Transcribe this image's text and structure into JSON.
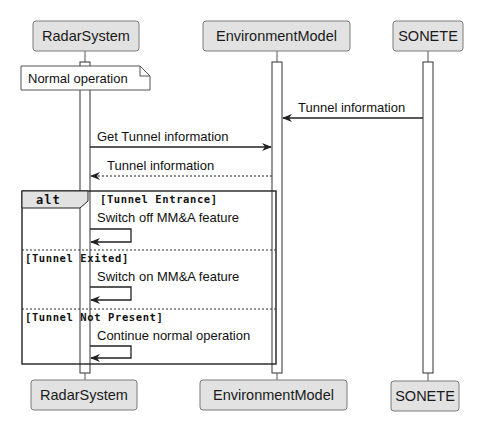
{
  "colors": {
    "participant_fill": "#e2e2e2",
    "participant_border": "#7a7a7a",
    "line": "#222222",
    "background": "#ffffff"
  },
  "participants": [
    {
      "name": "RadarSystem"
    },
    {
      "name": "EnvironmentModel"
    },
    {
      "name": "SONETE"
    }
  ],
  "note": {
    "text": "Normal operation",
    "over": "RadarSystem"
  },
  "messages": [
    {
      "from": "SONETE",
      "to": "EnvironmentModel",
      "label": "Tunnel information",
      "style": "solid"
    },
    {
      "from": "RadarSystem",
      "to": "EnvironmentModel",
      "label": "Get Tunnel information",
      "style": "solid"
    },
    {
      "from": "EnvironmentModel",
      "to": "RadarSystem",
      "label": "Tunnel information",
      "style": "dashed"
    }
  ],
  "alt": {
    "label": "alt",
    "branches": [
      {
        "guard": "[Tunnel Entrance]",
        "self_message": "Switch off MM&A feature"
      },
      {
        "guard": "[Tunnel Exited]",
        "self_message": "Switch on MM&A feature"
      },
      {
        "guard": "[Tunnel Not Present]",
        "self_message": "Continue normal operation"
      }
    ]
  }
}
